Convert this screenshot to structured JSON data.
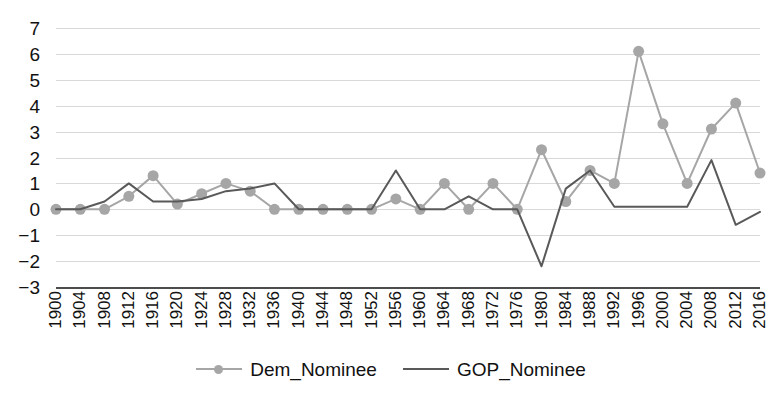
{
  "chart_data": {
    "type": "line",
    "title": "",
    "xlabel": "",
    "ylabel": "",
    "ylim": [
      -3,
      7
    ],
    "yticks": [
      7,
      6,
      5,
      4,
      3,
      2,
      1,
      0,
      -1,
      -2,
      -3
    ],
    "ytick_labels": [
      "7",
      "6",
      "5",
      "4",
      "3",
      "2",
      "1",
      "0",
      "−1",
      "−2",
      "−3"
    ],
    "grid": true,
    "legend_position": "bottom",
    "categories": [
      "1900",
      "1904",
      "1908",
      "1912",
      "1916",
      "1920",
      "1924",
      "1928",
      "1932",
      "1936",
      "1940",
      "1944",
      "1948",
      "1952",
      "1956",
      "1960",
      "1964",
      "1968",
      "1972",
      "1976",
      "1980",
      "1984",
      "1988",
      "1992",
      "1996",
      "2000",
      "2004",
      "2008",
      "2012",
      "2016"
    ],
    "series": [
      {
        "name": "Dem_Nominee",
        "color": "#a6a6a6",
        "marker": "circle",
        "values": [
          0,
          0,
          0,
          0.5,
          1.3,
          0.2,
          0.6,
          1.0,
          0.7,
          0,
          0,
          0,
          0,
          0,
          0.4,
          0,
          1.0,
          0,
          1.0,
          0,
          2.3,
          0.3,
          1.5,
          1.0,
          6.1,
          3.3,
          1.0,
          3.1,
          4.1,
          1.4
        ]
      },
      {
        "name": "GOP_Nominee",
        "color": "#595959",
        "marker": "none",
        "values": [
          0,
          0,
          0.3,
          1.0,
          0.3,
          0.3,
          0.4,
          0.7,
          0.8,
          1.0,
          0,
          0,
          0,
          0,
          1.5,
          0,
          0,
          0.5,
          0,
          0,
          -2.2,
          0.8,
          1.5,
          0.1,
          0.1,
          0.1,
          0.1,
          1.9,
          -0.6,
          -0.1
        ]
      }
    ]
  },
  "legend": {
    "entries": [
      {
        "label": "Dem_Nominee",
        "color": "#a6a6a6",
        "has_marker": true
      },
      {
        "label": "GOP_Nominee",
        "color": "#595959",
        "has_marker": false
      }
    ]
  },
  "colors": {
    "dem": "#a6a6a6",
    "gop": "#595959",
    "grid": "#d9d9d9",
    "axis": "#4d4d4d",
    "background": "#ffffff",
    "text": "#111111"
  }
}
